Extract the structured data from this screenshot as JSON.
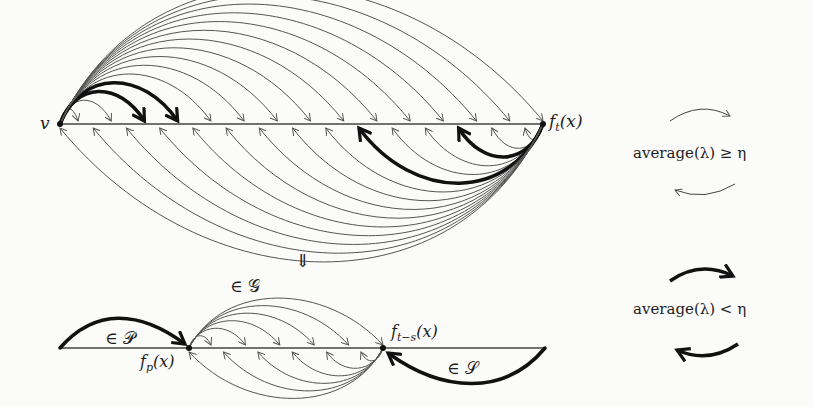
{
  "top_diagram": {
    "start_node": "v",
    "end_node": "f_t(x)",
    "end_node_display": {
      "main": "f",
      "sub": "t",
      "arg": "(x)"
    },
    "forward_arcs": 15,
    "backward_arcs": 15,
    "highlighted_forward": [
      2,
      3
    ],
    "highlighted_backward": [
      2,
      5
    ]
  },
  "transition": {
    "symbol": "⇓",
    "label": "∈ 𝒢"
  },
  "bottom_diagram": {
    "left_label": "∈ 𝒫",
    "node_left_display": {
      "main": "f",
      "sub": "p",
      "arg": "(x)"
    },
    "node_right_display": {
      "main": "f",
      "sub": "t−s",
      "arg": "(x)"
    },
    "right_label": "∈ 𝒮",
    "forward_arcs": 6,
    "backward_arcs": 6
  },
  "legend": {
    "thin": {
      "text": "average(λ) ≥ η",
      "stroke": "#444444"
    },
    "bold": {
      "text": "average(λ) < η",
      "stroke": "#111111"
    }
  }
}
